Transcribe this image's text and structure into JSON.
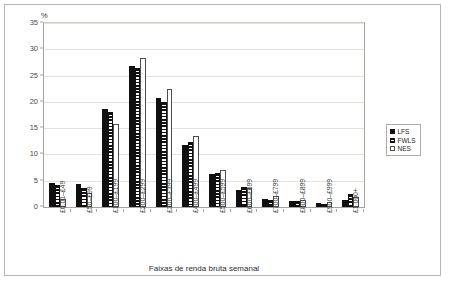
{
  "figure": {
    "y_unit_label": "%",
    "x_axis_title": "Faixas de renda bruta semanal"
  },
  "legend": {
    "position": "right",
    "items": [
      {
        "label": "LFS",
        "swatch": "solid-black-square-icon"
      },
      {
        "label": "FWLS",
        "swatch": "horizontal-stripe-square-icon"
      },
      {
        "label": "NES",
        "swatch": "empty-white-square-icon"
      }
    ]
  },
  "y_axis": {
    "ticks": [
      "0",
      "5",
      "10",
      "15",
      "20",
      "25",
      "30",
      "35"
    ]
  },
  "chart_data": {
    "type": "bar",
    "title": "",
    "subtitle": "",
    "xlabel": "Faixas de renda bruta semanal",
    "ylabel": "%",
    "ylim": [
      0,
      35
    ],
    "ytick_step": 5,
    "grid": true,
    "legend_position": "right",
    "categories": [
      "£0.01–£49",
      "£50–£99",
      "£100–£199",
      "£200–£299",
      "£300–£399",
      "£400–£499",
      "£500–£599",
      "£600–£699",
      "£700–£799",
      "£800–£899",
      "£900–£999",
      "£1 000+"
    ],
    "series": [
      {
        "name": "LFS",
        "fill": "solid-black",
        "values": [
          4.5,
          4.3,
          18.7,
          26.9,
          20.8,
          11.8,
          6.2,
          3.3,
          1.6,
          1.1,
          0.7,
          1.4
        ]
      },
      {
        "name": "FWLS",
        "fill": "horizontal-stripes",
        "values": [
          4.1,
          3.6,
          18.1,
          26.4,
          20.0,
          12.3,
          6.5,
          3.8,
          1.4,
          1.2,
          0.6,
          2.5
        ]
      },
      {
        "name": "NES",
        "fill": "white-outline",
        "values": [
          1.6,
          2.6,
          15.8,
          28.4,
          22.5,
          13.5,
          7.0,
          3.7,
          2.1,
          1.3,
          0.9,
          2.0
        ]
      }
    ]
  }
}
